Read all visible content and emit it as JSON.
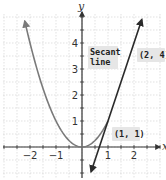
{
  "chart_data": {
    "type": "line",
    "title": "",
    "xlabel": "x",
    "ylabel": "y",
    "xlim": [
      -3,
      3
    ],
    "ylim": [
      -1,
      5
    ],
    "grid": true,
    "grid_step": 0.5,
    "x_ticks": [
      -2,
      -1,
      1,
      2
    ],
    "y_ticks": [
      1,
      2,
      3,
      4
    ],
    "x_tick_labels": [
      "−2",
      "−1",
      "1",
      "2"
    ],
    "y_tick_labels": [
      "1",
      "2",
      "3",
      "4"
    ],
    "series": [
      {
        "name": "parabola",
        "equation": "y = x^2",
        "x": [
          -2.2,
          -2,
          -1.5,
          -1,
          -0.5,
          0,
          0.5,
          1,
          1.5,
          2
        ],
        "y": [
          4.84,
          4,
          2.25,
          1,
          0.25,
          0,
          0.25,
          1,
          2.25,
          4
        ],
        "color": "#7a7a7a"
      },
      {
        "name": "Secant line",
        "equation": "y = 3x - 2",
        "x": [
          0.35,
          2.3
        ],
        "y": [
          -0.95,
          4.9
        ],
        "color": "#2a2a2a"
      }
    ],
    "points": [
      {
        "label": "(1, 1)",
        "x": 1,
        "y": 1
      },
      {
        "label": "(2, 4)",
        "x": 2,
        "y": 4
      }
    ],
    "annotations": [
      {
        "text": "Secant line",
        "line1": "Secant",
        "line2": "line"
      },
      {
        "text": "(2, 4)"
      },
      {
        "text": "(1, 1)"
      }
    ]
  }
}
